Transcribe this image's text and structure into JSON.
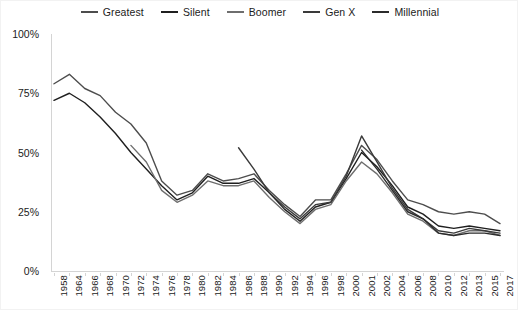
{
  "chart_data": {
    "type": "line",
    "title": "",
    "xlabel": "",
    "ylabel": "",
    "ylim": [
      0,
      100
    ],
    "ytick_labels": [
      "0%",
      "25%",
      "50%",
      "75%",
      "100%"
    ],
    "ytick_values": [
      0,
      25,
      50,
      75,
      100
    ],
    "grid": false,
    "legend_position": "top-center",
    "categories": [
      "1958",
      "1964",
      "1966",
      "1968",
      "1970",
      "1972",
      "1974",
      "1976",
      "1978",
      "1980",
      "1982",
      "1984",
      "1986",
      "1988",
      "1990",
      "1992",
      "1994",
      "1996",
      "1998",
      "2000",
      "2001",
      "2002",
      "2004",
      "2006",
      "2008",
      "2010",
      "2012",
      "2013",
      "2015",
      "2017"
    ],
    "series": [
      {
        "name": "Greatest",
        "color": "#4d4d4d",
        "values": [
          79,
          83,
          77,
          74,
          67,
          62,
          54,
          38,
          32,
          34,
          41,
          38,
          39,
          41,
          34,
          28,
          23,
          30,
          30,
          41,
          53,
          47,
          38,
          30,
          28,
          25,
          24,
          25,
          24,
          20
        ]
      },
      {
        "name": "Silent",
        "color": "#1f1f1f",
        "values": [
          72,
          75,
          71,
          65,
          58,
          50,
          43,
          36,
          30,
          33,
          40,
          37,
          37,
          39,
          33,
          26,
          21,
          27,
          29,
          39,
          50,
          44,
          36,
          27,
          24,
          19,
          18,
          19,
          18,
          17
        ]
      },
      {
        "name": "Boomer",
        "color": "#6e6e6e",
        "values": [
          null,
          null,
          null,
          null,
          null,
          53,
          46,
          34,
          29,
          32,
          38,
          36,
          36,
          38,
          31,
          25,
          20,
          26,
          28,
          38,
          46,
          41,
          33,
          24,
          21,
          16,
          15,
          17,
          17,
          15
        ]
      },
      {
        "name": "Gen X",
        "color": "#3a3a3a",
        "values": [
          null,
          null,
          null,
          null,
          null,
          null,
          null,
          null,
          null,
          null,
          null,
          null,
          52,
          43,
          33,
          27,
          22,
          28,
          29,
          40,
          57,
          46,
          35,
          26,
          22,
          17,
          16,
          18,
          17,
          16
        ]
      },
      {
        "name": "Millennial",
        "color": "#2b2b2b",
        "values": [
          null,
          null,
          null,
          null,
          null,
          null,
          null,
          null,
          null,
          null,
          null,
          null,
          null,
          null,
          null,
          null,
          null,
          null,
          null,
          null,
          51,
          43,
          34,
          25,
          22,
          16,
          15,
          16,
          16,
          15
        ]
      }
    ]
  },
  "legend": {
    "items": [
      {
        "label": "Greatest"
      },
      {
        "label": "Silent"
      },
      {
        "label": "Boomer"
      },
      {
        "label": "Gen X"
      },
      {
        "label": "Millennial"
      }
    ]
  }
}
